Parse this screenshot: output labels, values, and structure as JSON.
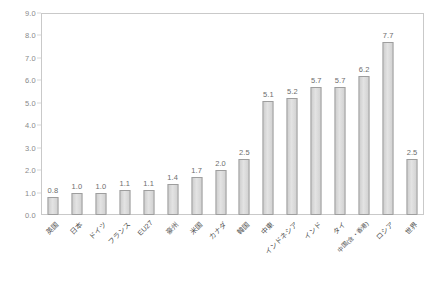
{
  "chart_data": {
    "type": "bar",
    "title": "",
    "subtitle": "",
    "xlabel": "",
    "ylabel": "",
    "ylim": [
      0.0,
      9.0
    ],
    "ytick_step": 1.0,
    "grid": false,
    "legend": "none",
    "categories": [
      "英国",
      "日本",
      "ドイツ",
      "フランス",
      "EU27",
      "豪州",
      "米国",
      "カナダ",
      "韓国",
      "中東",
      "インドネシア",
      "インド",
      "タイ",
      "中国(含・香港)",
      "ロシア",
      "世界"
    ],
    "values": [
      0.8,
      1.0,
      1.0,
      1.1,
      1.1,
      1.4,
      1.7,
      2.0,
      2.5,
      5.1,
      5.2,
      5.7,
      5.7,
      6.2,
      7.7,
      2.5
    ],
    "value_labels": [
      "0.8",
      "1.0",
      "1.0",
      "1.1",
      "1.1",
      "1.4",
      "1.7",
      "2.0",
      "2.5",
      "5.1",
      "5.2",
      "5.7",
      "5.7",
      "6.2",
      "7.7",
      "2.5"
    ],
    "ytick_labels": [
      "0.0",
      "1.0",
      "2.0",
      "3.0",
      "4.0",
      "5.0",
      "6.0",
      "7.0",
      "8.0",
      "9.0"
    ],
    "ytick_values": [
      0.0,
      1.0,
      2.0,
      3.0,
      4.0,
      5.0,
      6.0,
      7.0,
      8.0,
      9.0
    ],
    "colors": {
      "bar_fill": "#d6d6d6",
      "bar_border": "#9e9e9e",
      "axis": "#c9c9c9",
      "tick_text": "#8a8a8a",
      "label_text": "#4f4f4f",
      "value_text": "#6d6d6d",
      "background": "#ffffff"
    }
  }
}
